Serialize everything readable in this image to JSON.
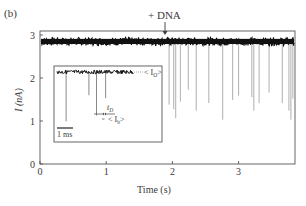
{
  "panel_label": "(b)",
  "chart_data": {
    "type": "line",
    "title": "",
    "annotation_top": "+ DNA",
    "annotation_top_x": 1.9,
    "xlabel": "Time (s)",
    "ylabel": "I (nA)",
    "xlim": [
      0,
      3.85
    ],
    "ylim": [
      0,
      3.0
    ],
    "xticks": [
      0,
      1,
      2,
      3
    ],
    "xtick_labels": [
      "0",
      "1",
      "2",
      "3"
    ],
    "yticks": [
      0,
      1,
      2,
      3
    ],
    "ytick_labels": [
      "0",
      "1",
      "2",
      "3"
    ],
    "grid": false,
    "baseline_current": 2.85,
    "baseline_noise": 0.06,
    "series": [
      {
        "name": "Open pore current",
        "x_range": [
          0,
          3.85
        ],
        "y": 2.85
      },
      {
        "name": "Translocation events",
        "events": [
          {
            "t": 1.95,
            "depth": 2.1
          },
          {
            "t": 2.02,
            "depth": 2.25
          },
          {
            "t": 2.05,
            "depth": 2.55
          },
          {
            "t": 2.12,
            "depth": 2.0
          },
          {
            "t": 2.24,
            "depth": 1.6
          },
          {
            "t": 2.36,
            "depth": 2.3
          },
          {
            "t": 2.55,
            "depth": 2.05
          },
          {
            "t": 2.76,
            "depth": 2.6
          },
          {
            "t": 2.91,
            "depth": 1.95
          },
          {
            "t": 3.0,
            "depth": 1.8
          },
          {
            "t": 3.2,
            "depth": 1.85
          },
          {
            "t": 3.23,
            "depth": 2.3
          },
          {
            "t": 3.31,
            "depth": 2.05
          },
          {
            "t": 3.46,
            "depth": 1.7
          },
          {
            "t": 3.66,
            "depth": 2.05
          },
          {
            "t": 3.76,
            "depth": 2.3
          },
          {
            "t": 3.79,
            "depth": 2.6
          },
          {
            "t": 3.82,
            "depth": 1.9
          }
        ]
      }
    ],
    "inset": {
      "label_open": "< I",
      "label_open_sub": "O",
      "label_open_end": ">",
      "label_blocked": "< I",
      "label_blocked_sub": "b",
      "label_blocked_end": ">",
      "label_dwell": "t",
      "label_dwell_sub": "D",
      "scale_bar": "1 ms",
      "events": [
        {
          "pos": 0.12,
          "depth": 0.85
        },
        {
          "pos": 0.42,
          "depth": 0.4
        },
        {
          "pos": 0.52,
          "depth": 0.75
        },
        {
          "pos": 0.64,
          "depth": 0.45
        }
      ]
    }
  }
}
